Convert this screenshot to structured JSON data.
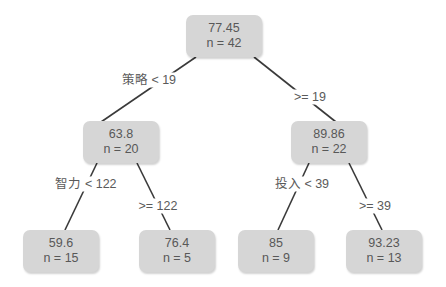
{
  "tree": {
    "nodes": [
      {
        "id": "root",
        "mean": "77.45",
        "n": "n = 42"
      },
      {
        "id": "left",
        "mean": "63.8",
        "n": "n = 20"
      },
      {
        "id": "right",
        "mean": "89.86",
        "n": "n = 22"
      },
      {
        "id": "left-left",
        "mean": "59.6",
        "n": "n = 15"
      },
      {
        "id": "left-right",
        "mean": "76.4",
        "n": "n = 5"
      },
      {
        "id": "right-left",
        "mean": "85",
        "n": "n = 9"
      },
      {
        "id": "right-right",
        "mean": "93.23",
        "n": "n = 13"
      }
    ],
    "splits": [
      {
        "from": "root",
        "to": "left",
        "label": "策略 < 19"
      },
      {
        "from": "root",
        "to": "right",
        "label": ">= 19"
      },
      {
        "from": "left",
        "to": "left-left",
        "label": "智力 < 122"
      },
      {
        "from": "left",
        "to": "left-right",
        "label": ">= 122"
      },
      {
        "from": "right",
        "to": "right-left",
        "label": "投入 < 39"
      },
      {
        "from": "right",
        "to": "right-right",
        "label": ">= 39"
      }
    ]
  },
  "colors": {
    "node_fill": "#d6d6d6",
    "edge": "#3a3a3a",
    "text": "#585858"
  }
}
